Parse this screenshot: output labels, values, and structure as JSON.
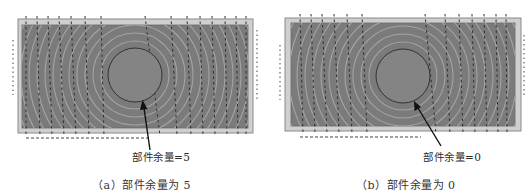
{
  "figure": {
    "panels": [
      {
        "id": "a",
        "annotation": "部件余量=5",
        "caption": "（a）部件余量为 5",
        "allowance": 5
      },
      {
        "id": "b",
        "annotation": "部件余量=0",
        "caption": "（b）部件余量为 0",
        "allowance": 0
      }
    ],
    "colors": {
      "background": "#ffffff",
      "outer_frame": "#c9c9c9",
      "frame_edge": "#8a8a8a",
      "part_fill": "#7a7a7a",
      "ring_lines": "#a9a9a9",
      "circle_edge": "#3a3a3a",
      "circle_fill": "#838383",
      "toolpath_dashes": "#303030",
      "arrow": "#111111"
    }
  }
}
